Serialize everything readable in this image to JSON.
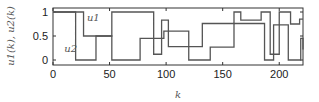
{
  "chart_data": {
    "type": "line",
    "step": true,
    "title": "",
    "xlabel": "k",
    "ylabel": "u1(k), u2(k)",
    "xlim": [
      0,
      221
    ],
    "ylim": [
      -0.08,
      1.08
    ],
    "xticks": [
      0,
      50,
      100,
      150,
      200
    ],
    "xtick_labels": [
      "0",
      "50",
      "100",
      "150",
      "200"
    ],
    "yticks": [
      0,
      0.5,
      1
    ],
    "ytick_labels": [
      "0",
      "0.5",
      "1"
    ],
    "grid": false,
    "legend": "inline annotations",
    "annotations": [
      {
        "text": "u1",
        "x": 30,
        "y": 0.82
      },
      {
        "text": "u2",
        "x": 10,
        "y": 0.16
      }
    ],
    "series": [
      {
        "name": "u1",
        "x": [
          0,
          27,
          52,
          89,
          96,
          102,
          121,
          132,
          160,
          166,
          184,
          192,
          200,
          210,
          218,
          221
        ],
        "values": [
          1,
          0.5,
          1,
          0.12,
          0.83,
          0.28,
          0.28,
          0.76,
          1,
          0.83,
          1,
          0.12,
          1,
          0.75,
          0.85,
          0.85
        ]
      },
      {
        "name": "u2",
        "x": [
          0,
          20,
          38,
          52,
          77,
          90,
          98,
          108,
          120,
          139,
          160,
          187,
          195,
          208,
          219,
          221
        ],
        "values": [
          1,
          0,
          0.5,
          0,
          0.45,
          0.45,
          0.6,
          0.6,
          0,
          0.27,
          0.76,
          0,
          0.73,
          0,
          0.45,
          0.22
        ]
      }
    ]
  }
}
